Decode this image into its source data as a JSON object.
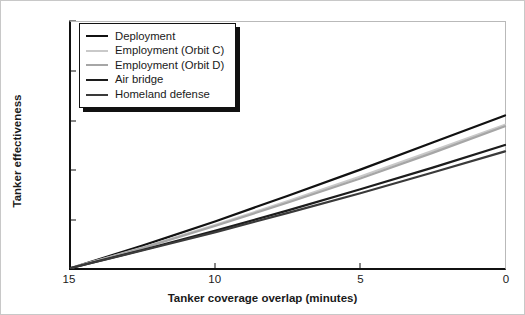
{
  "chart_data": {
    "type": "line",
    "title": "",
    "xlabel": "Tanker coverage overlap (minutes)",
    "ylabel": "Tanker effectiveness",
    "xlim": [
      15,
      0
    ],
    "ylim": [
      1.0,
      1.05
    ],
    "x_ticks": [
      "15",
      "10",
      "5",
      "0"
    ],
    "x_tick_values": [
      15,
      10,
      5,
      0
    ],
    "y_ticks": [
      "1.00",
      "1.01",
      "1.02",
      "1.03",
      "1.04",
      "1.05"
    ],
    "y_tick_values": [
      1.0,
      1.01,
      1.02,
      1.03,
      1.04,
      1.05
    ],
    "grid": false,
    "legend_position": "upper-left",
    "x": [
      15,
      12.5,
      10,
      7.5,
      5,
      2.5,
      0
    ],
    "series": [
      {
        "name": "Deployment",
        "color": "#111111",
        "width": 2.2,
        "values": [
          1.0,
          1.0046,
          1.0095,
          1.0147,
          1.02,
          1.0255,
          1.031
        ]
      },
      {
        "name": "Employment (Orbit C)",
        "color": "#c9c9c9",
        "width": 2.2,
        "values": [
          1.0,
          1.0042,
          1.0088,
          1.0136,
          1.0186,
          1.0238,
          1.0291
        ]
      },
      {
        "name": "Employment (Orbit D)",
        "color": "#a6a6a6",
        "width": 2.2,
        "values": [
          1.0,
          1.0041,
          1.0086,
          1.0133,
          1.0182,
          1.0234,
          1.0288
        ]
      },
      {
        "name": "Air bridge",
        "color": "#1c1c1c",
        "width": 2.2,
        "values": [
          1.0,
          1.0037,
          1.0076,
          1.0117,
          1.016,
          1.0204,
          1.025
        ]
      },
      {
        "name": "Homeland defense",
        "color": "#3a3a3a",
        "width": 2.2,
        "values": [
          1.0,
          1.0036,
          1.0073,
          1.0112,
          1.0152,
          1.0194,
          1.0237
        ]
      }
    ]
  },
  "axes": {
    "y_label": "Tanker effectiveness",
    "x_label": "Tanker coverage overlap (minutes)",
    "y_ticks": [
      "1.05",
      "1.04",
      "1.03",
      "1.02",
      "1.01",
      "1.00"
    ],
    "x_ticks": [
      "15",
      "10",
      "5",
      "0"
    ]
  },
  "legend": {
    "items": [
      {
        "label": "Deployment"
      },
      {
        "label": "Employment (Orbit C)"
      },
      {
        "label": "Employment (Orbit D)"
      },
      {
        "label": "Air bridge"
      },
      {
        "label": "Homeland defense"
      }
    ]
  }
}
